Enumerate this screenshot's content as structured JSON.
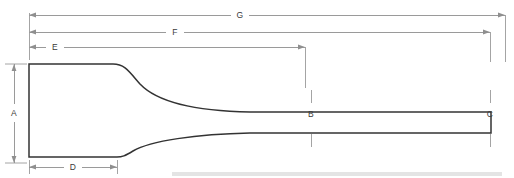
{
  "figure": {
    "type": "engineering-dimension-drawing",
    "canvas": {
      "width": 514,
      "height": 178
    },
    "colors": {
      "outline": "#333333",
      "dimension_line": "#8f8f8f",
      "extension_line": "#9a9a9a",
      "label_text": "#3a3a3a",
      "background": "#ffffff",
      "baseline_bar": "#e4e4e4"
    }
  },
  "dimensions": {
    "a": {
      "label": "A",
      "orientation": "vertical",
      "description": "blade head height at left end",
      "label_x": 14,
      "label_y": 113,
      "line_x": 14,
      "y_start": 64,
      "y_end": 163
    },
    "b": {
      "label": "B",
      "orientation": "callout",
      "description": "shank thickness callout at mid span",
      "label_x": 311,
      "label_y": 114,
      "tick_x": 311,
      "tick_top_y1": 90,
      "tick_top_y2": 102,
      "tick_bottom_y1": 131,
      "tick_bottom_y2": 146
    },
    "c": {
      "label": "C",
      "orientation": "callout",
      "description": "shank thickness callout near right end",
      "label_x": 490,
      "label_y": 114,
      "tick_x": 490,
      "tick_top_y1": 90,
      "tick_top_y2": 102,
      "tick_bottom_y1": 131,
      "tick_bottom_y2": 146
    },
    "d": {
      "label": "D",
      "orientation": "horizontal",
      "description": "blade head length at bottom",
      "label_x": 73,
      "label_y": 167,
      "line_y": 167,
      "x_start": 29,
      "x_end": 117
    },
    "e": {
      "label": "E",
      "orientation": "horizontal",
      "description": "length to first shank reference",
      "label_x": 55,
      "label_y": 47,
      "line_y": 47,
      "x_start": 29,
      "x_end": 305
    },
    "f": {
      "label": "F",
      "orientation": "horizontal",
      "description": "length to second shank reference",
      "label_x": 175,
      "label_y": 32,
      "line_y": 32,
      "x_start": 29,
      "x_end": 490
    },
    "g": {
      "label": "G",
      "orientation": "horizontal",
      "description": "overall length",
      "label_x": 240,
      "label_y": 15,
      "line_y": 15,
      "x_start": 29,
      "x_end": 505
    }
  },
  "profile": {
    "description": "Flat chisel with wide rectangular head at left tapering through a concave fillet into a long slender parallel shank terminating in a blunt right end.",
    "head": {
      "left_x": 29,
      "top_y": 64,
      "bottom_y": 163,
      "taper_start_x": 117
    },
    "shank": {
      "right_x": 491,
      "top_y": 112,
      "bottom_y": 133
    }
  },
  "baseline_bar": {
    "x": 172,
    "y": 172,
    "width": 330,
    "height": 4
  }
}
